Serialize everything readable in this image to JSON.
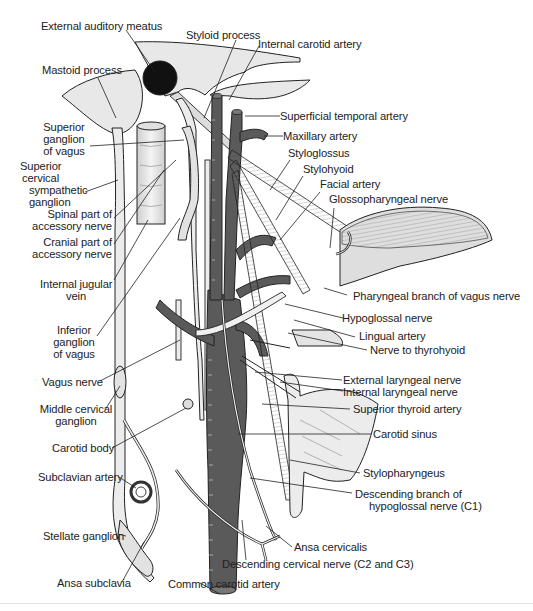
{
  "figure": {
    "colors": {
      "artery": "#5a5a5a",
      "bone": "#e6e6e6",
      "nerve_fill": "#ececec",
      "outline": "#222222",
      "label_text": "#222222"
    },
    "labels": {
      "external_auditory_meatus": "External auditory meatus",
      "styloid_process": "Styloid process",
      "internal_carotid_artery": "Internal carotid artery",
      "mastoid_process": "Mastoid process",
      "superficial_temporal_artery": "Superficial temporal artery",
      "maxillary_artery": "Maxillary artery",
      "superior_ganglion_of_vagus": [
        "Superior",
        "ganglion",
        "of vagus"
      ],
      "styloglossus": "Styloglossus",
      "stylohyoid": "Stylohyoid",
      "superior_cervical_sympathetic_ganglion": [
        "Superior",
        "cervical",
        "sympathetic",
        "ganglion"
      ],
      "facial_artery": "Facial artery",
      "glossopharyngeal_nerve": "Glossopharyngeal nerve",
      "spinal_part_of_accessory_nerve": [
        "Spinal part of",
        "accessory nerve"
      ],
      "cranial_part_of_accessory_nerve": [
        "Cranial part of",
        "accessory nerve"
      ],
      "internal_jugular_vein": [
        "Internal jugular",
        "vein"
      ],
      "pharyngeal_branch_of_vagus_nerve": "Pharyngeal branch of vagus nerve",
      "inferior_ganglion_of_vagus": [
        "Inferior",
        "ganglion",
        "of vagus"
      ],
      "hypoglossal_nerve": "Hypoglossal nerve",
      "lingual_artery": "Lingual artery",
      "nerve_to_thyrohyoid": "Nerve to thyrohyoid",
      "vagus_nerve": "Vagus nerve",
      "external_laryngeal_nerve": "External laryngeal nerve",
      "internal_laryngeal_nerve": "Internal laryngeal nerve",
      "middle_cervical_ganglion": [
        "Middle cervical",
        "ganglion"
      ],
      "superior_thyroid_artery": "Superior thyroid artery",
      "carotid_body": "Carotid body",
      "carotid_sinus": "Carotid sinus",
      "subclavian_artery": "Subclavian artery",
      "stylopharyngeus": "Stylopharyngeus",
      "descending_branch_of_hypoglossal_nerve": [
        "Descending branch of",
        "hypoglossal nerve (C1)"
      ],
      "stellate_ganglion": "Stellate ganglion",
      "ansa_cervicalis": "Ansa cervicalis",
      "descending_cervical_nerve": "Descending cervical nerve (C2 and C3)",
      "ansa_subclavia": "Ansa subclavia",
      "common_carotid_artery": "Common carotid artery"
    }
  }
}
